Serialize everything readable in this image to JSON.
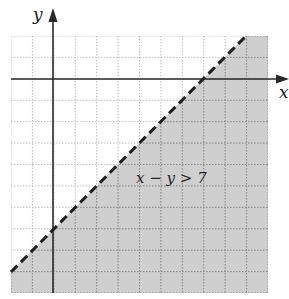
{
  "chart_data": {
    "type": "line",
    "title": "",
    "xlabel": "x",
    "ylabel": "y",
    "xlim": [
      -2,
      10
    ],
    "ylim": [
      -10,
      2
    ],
    "grid": true,
    "grid_step": 1,
    "tick_labels_shown": false,
    "boundary": {
      "equation": "y = x - 7",
      "style": "dashed",
      "points": [
        [
          -2,
          -9
        ],
        [
          9,
          2
        ]
      ],
      "x_intercept": 7,
      "y_intercept": -7
    },
    "shaded_region": "below boundary (x - y > 7)",
    "annotations": [
      {
        "text": "x − y > 7",
        "x": 5.2,
        "y": -4.8
      }
    ],
    "colors": {
      "shade": "#cfcfcf",
      "grid_light": "#bdbdbd",
      "grid_dark": "#8a8a8a",
      "axis": "#2a2a2a",
      "boundary": "#1e1e1e"
    }
  },
  "labels": {
    "x_axis": "x",
    "y_axis": "y",
    "inequality": "x − y > 7"
  }
}
